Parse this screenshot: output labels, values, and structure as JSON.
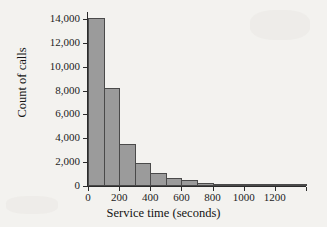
{
  "chart_data": {
    "type": "bar",
    "title": "",
    "subtitle": "",
    "xlabel": "Service time (seconds)",
    "ylabel": "Count of calls",
    "grid": false,
    "legend": null,
    "xlim": [
      0,
      1400
    ],
    "ylim": [
      0,
      14600
    ],
    "bin_width": 100,
    "xticks": [
      0,
      200,
      400,
      600,
      800,
      1000,
      1200
    ],
    "xtick_labels": [
      "0",
      "200",
      "400",
      "600",
      "800",
      "1000",
      "1200"
    ],
    "yticks": [
      0,
      2000,
      4000,
      6000,
      8000,
      10000,
      12000,
      14000
    ],
    "ytick_labels": [
      "0",
      "2,000",
      "4,000",
      "6,000",
      "8,000",
      "10,000",
      "12,000",
      "14,000"
    ],
    "bin_edges": [
      0,
      100,
      200,
      300,
      400,
      500,
      600,
      700,
      800,
      900,
      1000,
      1100,
      1200,
      1300,
      1400
    ],
    "categories": [
      "0-100",
      "100-200",
      "200-300",
      "300-400",
      "400-500",
      "500-600",
      "600-700",
      "700-800",
      "800-900",
      "900-1000",
      "1000-1100",
      "1100-1200",
      "1200-1300",
      "1300-1400"
    ],
    "values": [
      14100,
      8250,
      3550,
      1950,
      1100,
      700,
      480,
      250,
      130,
      90,
      60,
      40,
      25,
      15
    ],
    "bar_color": "#9b9b9b",
    "bar_edge_color": "#4a4a4a",
    "background_color": "#f3f2ef",
    "axis_color": "#2b2b2b"
  },
  "figure": {
    "axis_title_x": "Service time (seconds)",
    "axis_title_y": "Count of calls"
  }
}
